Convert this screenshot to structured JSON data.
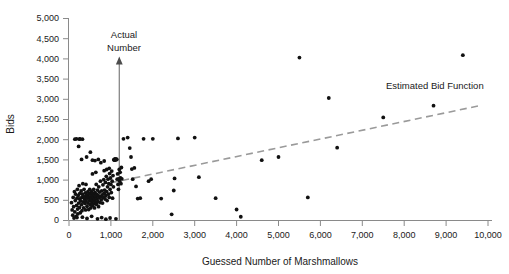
{
  "chart_data": {
    "type": "scatter",
    "title": "",
    "xlabel": "Guessed Number of Marshmallows",
    "ylabel": "Bids",
    "xlim": [
      0,
      10000
    ],
    "ylim": [
      0,
      5000
    ],
    "grid": false,
    "legend_position": "none",
    "x_ticks": [
      0,
      1000,
      2000,
      3000,
      4000,
      5000,
      6000,
      7000,
      8000,
      9000,
      10000
    ],
    "x_tick_labels": [
      "0",
      "1,000",
      "2,000",
      "3,000",
      "4,000",
      "5,000",
      "6,000",
      "7,000",
      "8,000",
      "9,000",
      "10,000"
    ],
    "y_ticks": [
      0,
      500,
      1000,
      1500,
      2000,
      2500,
      3000,
      3500,
      4000,
      4500,
      5000
    ],
    "y_tick_labels": [
      "0",
      "500",
      "1,000",
      "1,500",
      "2,000",
      "2,500",
      "3,000",
      "3,500",
      "4,000",
      "4,500",
      "5,000"
    ],
    "annotations": [
      {
        "name": "actual-number-marker",
        "label": "Actual Number",
        "label_line_1": "Actual",
        "label_line_2": "Number",
        "type": "vertical-arrow",
        "x": 1200,
        "y_top": 3900
      },
      {
        "name": "estimated-bid-function",
        "label": "Estimated Bid Function",
        "type": "dashed-line-label"
      }
    ],
    "trend_line": {
      "name": "Estimated Bid Function",
      "style": "dashed",
      "color": "#9a9a9a",
      "x_start": 1000,
      "y_start": 920,
      "x_end": 9850,
      "y_end": 2840
    },
    "series": [
      {
        "name": "Bids vs Guessed Number of Marshmallows",
        "marker": "filled-circle",
        "color": "#111111",
        "points": [
          [
            60,
            430
          ],
          [
            75,
            250
          ],
          [
            90,
            120
          ],
          [
            100,
            560
          ],
          [
            110,
            330
          ],
          [
            120,
            50
          ],
          [
            130,
            700
          ],
          [
            140,
            200
          ],
          [
            150,
            480
          ],
          [
            160,
            640
          ],
          [
            170,
            90
          ],
          [
            180,
            360
          ],
          [
            190,
            540
          ],
          [
            200,
            760
          ],
          [
            205,
            270
          ],
          [
            210,
            150
          ],
          [
            220,
            600
          ],
          [
            230,
            420
          ],
          [
            240,
            850
          ],
          [
            250,
            310
          ],
          [
            255,
            520
          ],
          [
            260,
            660
          ],
          [
            270,
            180
          ],
          [
            280,
            470
          ],
          [
            290,
            720
          ],
          [
            300,
            380
          ],
          [
            305,
            560
          ],
          [
            310,
            230
          ],
          [
            320,
            640
          ],
          [
            330,
            900
          ],
          [
            340,
            450
          ],
          [
            350,
            300
          ],
          [
            355,
            580
          ],
          [
            360,
            760
          ],
          [
            370,
            520
          ],
          [
            380,
            410
          ],
          [
            390,
            670
          ],
          [
            395,
            250
          ],
          [
            400,
            560
          ],
          [
            405,
            880
          ],
          [
            410,
            470
          ],
          [
            420,
            620
          ],
          [
            430,
            340
          ],
          [
            440,
            540
          ],
          [
            450,
            700
          ],
          [
            455,
            420
          ],
          [
            460,
            580
          ],
          [
            470,
            260
          ],
          [
            480,
            660
          ],
          [
            490,
            480
          ],
          [
            495,
            760
          ],
          [
            500,
            560
          ],
          [
            505,
            380
          ],
          [
            510,
            640
          ],
          [
            520,
            300
          ],
          [
            530,
            520
          ],
          [
            540,
            700
          ],
          [
            545,
            430
          ],
          [
            550,
            590
          ],
          [
            560,
            350
          ],
          [
            565,
            660
          ],
          [
            570,
            480
          ],
          [
            580,
            560
          ],
          [
            590,
            760
          ],
          [
            595,
            400
          ],
          [
            600,
            620
          ],
          [
            605,
            510
          ],
          [
            610,
            300
          ],
          [
            620,
            680
          ],
          [
            630,
            450
          ],
          [
            640,
            570
          ],
          [
            650,
            880
          ],
          [
            655,
            390
          ],
          [
            660,
            640
          ],
          [
            670,
            520
          ],
          [
            680,
            740
          ],
          [
            690,
            460
          ],
          [
            700,
            600
          ],
          [
            705,
            330
          ],
          [
            710,
            820
          ],
          [
            720,
            550
          ],
          [
            730,
            690
          ],
          [
            740,
            430
          ],
          [
            750,
            960
          ],
          [
            760,
            580
          ],
          [
            770,
            500
          ],
          [
            780,
            720
          ],
          [
            790,
            620
          ],
          [
            800,
            420
          ],
          [
            810,
            870
          ],
          [
            820,
            560
          ],
          [
            830,
            1000
          ],
          [
            840,
            660
          ],
          [
            850,
            740
          ],
          [
            860,
            520
          ],
          [
            870,
            930
          ],
          [
            880,
            600
          ],
          [
            890,
            1080
          ],
          [
            900,
            700
          ],
          [
            910,
            480
          ],
          [
            920,
            820
          ],
          [
            930,
            1010
          ],
          [
            940,
            640
          ],
          [
            950,
            900
          ],
          [
            960,
            560
          ],
          [
            970,
            1150
          ],
          [
            980,
            760
          ],
          [
            990,
            1040
          ],
          [
            1000,
            880
          ],
          [
            1010,
            680
          ],
          [
            1020,
            1210
          ],
          [
            1030,
            960
          ],
          [
            1040,
            540
          ],
          [
            1050,
            1100
          ],
          [
            1060,
            820
          ],
          [
            1070,
            1490
          ],
          [
            1080,
            1500
          ],
          [
            1090,
            1480
          ],
          [
            1100,
            1510
          ],
          [
            1110,
            1500
          ],
          [
            1120,
            1490
          ],
          [
            1130,
            1505
          ],
          [
            1140,
            1500
          ],
          [
            1150,
            1010
          ],
          [
            1160,
            1140
          ],
          [
            1170,
            880
          ],
          [
            1180,
            760
          ],
          [
            1190,
            1020
          ],
          [
            1200,
            1250
          ],
          [
            1210,
            960
          ],
          [
            1220,
            1180
          ],
          [
            1230,
            1040
          ],
          [
            1240,
            900
          ],
          [
            1250,
            1300
          ],
          [
            1260,
            1020
          ],
          [
            140,
            2000
          ],
          [
            180,
            2010
          ],
          [
            250,
            2000
          ],
          [
            260,
            2010
          ],
          [
            320,
            2000
          ],
          [
            230,
            1820
          ],
          [
            300,
            1500
          ],
          [
            420,
            1560
          ],
          [
            510,
            1680
          ],
          [
            560,
            1480
          ],
          [
            620,
            1470
          ],
          [
            700,
            1500
          ],
          [
            760,
            1420
          ],
          [
            840,
            1460
          ],
          [
            900,
            1250
          ],
          [
            560,
            1140
          ],
          [
            640,
            1180
          ],
          [
            840,
            1220
          ],
          [
            960,
            1280
          ],
          [
            190,
            60
          ],
          [
            320,
            70
          ],
          [
            430,
            40
          ],
          [
            540,
            90
          ],
          [
            680,
            30
          ],
          [
            780,
            60
          ],
          [
            880,
            20
          ],
          [
            980,
            50
          ],
          [
            1120,
            30
          ],
          [
            1300,
            2010
          ],
          [
            1400,
            2040
          ],
          [
            1450,
            1780
          ],
          [
            1480,
            1560
          ],
          [
            1500,
            1260
          ],
          [
            1520,
            1010
          ],
          [
            1560,
            1290
          ],
          [
            1600,
            830
          ],
          [
            1640,
            530
          ],
          [
            1700,
            540
          ],
          [
            1780,
            2010
          ],
          [
            1900,
            960
          ],
          [
            1960,
            1010
          ],
          [
            2000,
            2010
          ],
          [
            2200,
            530
          ],
          [
            2450,
            140
          ],
          [
            2500,
            730
          ],
          [
            2520,
            1030
          ],
          [
            2600,
            2020
          ],
          [
            3000,
            2040
          ],
          [
            3100,
            1060
          ],
          [
            3500,
            540
          ],
          [
            4000,
            260
          ],
          [
            4100,
            80
          ],
          [
            4600,
            1480
          ],
          [
            5000,
            1560
          ],
          [
            5500,
            4020
          ],
          [
            5700,
            560
          ],
          [
            6200,
            3020
          ],
          [
            6400,
            1790
          ],
          [
            7500,
            2540
          ],
          [
            8700,
            2830
          ],
          [
            9400,
            4080
          ]
        ]
      }
    ]
  }
}
